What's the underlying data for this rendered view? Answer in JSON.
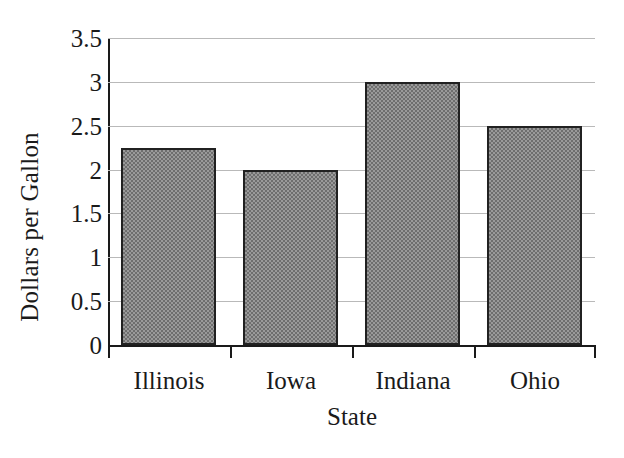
{
  "chart_data": {
    "type": "bar",
    "title": "",
    "subtitle": "",
    "categories": [
      "Illinois",
      "Iowa",
      "Indiana",
      "Ohio"
    ],
    "values": [
      2.25,
      2,
      3,
      2.5
    ],
    "xlabel": "State",
    "ylabel": "Dollars per Gallon",
    "ylim": [
      0,
      3.5
    ],
    "yticks": [
      0,
      0.5,
      1,
      1.5,
      2,
      2.5,
      3,
      3.5
    ],
    "ytick_labels": [
      "0",
      "0.5",
      "1",
      "1.5",
      "2",
      "2.5",
      "3",
      "3.5"
    ],
    "grid": true,
    "grid_axis": "y",
    "legend": false,
    "legend_position": "none",
    "annotations": [],
    "colors": {
      "bar_fill": "#9a9a9a",
      "bar_pattern": "#6e6e6e",
      "bar_border": "#212121",
      "gridline": "#b9b9b9",
      "axis": "#1a1a1a",
      "text": "#1a1a1a",
      "background": "#ffffff"
    }
  }
}
